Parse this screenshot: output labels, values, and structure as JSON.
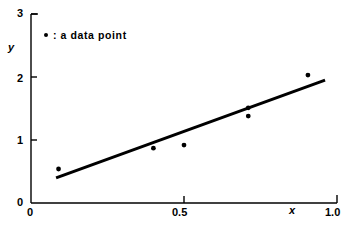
{
  "chart_data": {
    "type": "scatter",
    "title": "",
    "xlabel": "x",
    "ylabel": "y",
    "xlim": [
      0,
      1.0
    ],
    "ylim": [
      0,
      3
    ],
    "grid": false,
    "legend_position": "top-left",
    "legend_entries": [
      {
        "marker": "dot",
        "label": ": a data point"
      }
    ],
    "x_ticks": [
      {
        "value": 0,
        "label": "0"
      },
      {
        "value": 0.5,
        "label": "0.5"
      },
      {
        "value": 1.0,
        "label": "1.0"
      }
    ],
    "y_ticks": [
      {
        "value": 0,
        "label": "0"
      },
      {
        "value": 1,
        "label": "1"
      },
      {
        "value": 2,
        "label": "2"
      },
      {
        "value": 3,
        "label": "3"
      }
    ],
    "series": [
      {
        "name": "a data point",
        "type": "scatter",
        "marker": "dot",
        "color": "#000000",
        "points": [
          {
            "x": 0.09,
            "y": 0.54
          },
          {
            "x": 0.4,
            "y": 0.87
          },
          {
            "x": 0.5,
            "y": 0.92
          },
          {
            "x": 0.71,
            "y": 1.51
          },
          {
            "x": 0.71,
            "y": 1.38
          },
          {
            "x": 0.905,
            "y": 2.03
          }
        ]
      },
      {
        "name": "fitted line",
        "type": "line",
        "color": "#000000",
        "points": [
          {
            "x": 0.082,
            "y": 0.4
          },
          {
            "x": 0.961,
            "y": 1.95
          }
        ]
      }
    ]
  },
  "axes": {
    "y": {
      "title": "y",
      "tick_labels": [
        "0",
        "1",
        "2",
        "3"
      ]
    },
    "x": {
      "title": "x",
      "tick_labels": [
        "0",
        "0.5",
        "1.0"
      ]
    }
  },
  "legend": {
    "marker_name": "data-point-marker",
    "text": ": a data point"
  }
}
